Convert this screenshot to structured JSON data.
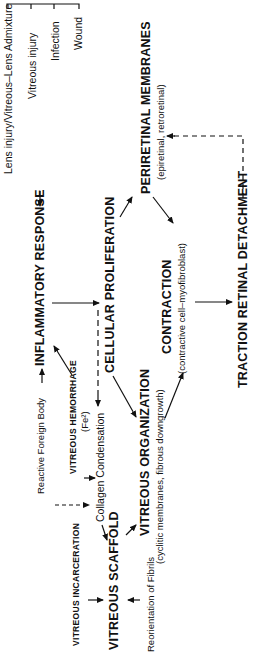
{
  "diagram": {
    "orientation": "rotated -90 degrees (text reads bottom-to-top)",
    "causes": {
      "items": [
        "Lens injury/Vitreous–Lens Admixture",
        "Vitreous injury",
        "Infection",
        "Wound"
      ]
    },
    "nodes": {
      "inflammatory_response": "INFLAMMATORY RESPONSE",
      "reactive_foreign_body": "Reactive Foreign Body",
      "vitreous_hemorrhage": "VITREOUS HEMORRHAGE",
      "vitreous_hemorrhage_note": "(Fe²)",
      "collagen_condensation": "Collagen Condensation",
      "vitreous_incarceration": "VITREOUS INCARCERATION",
      "vitreous_scaffold": "VITREOUS SCAFFOLD",
      "reorientation_of_fibrils": "Reorientation of Fibrils",
      "cellular_proliferation": "CELLULAR PROLIFERATION",
      "vitreous_organization": "VITREOUS ORGANIZATION",
      "vitreous_organization_note": "(cyclitic membranes, fibrous downgrowth)",
      "periretinal_membranes": "PERIRETINAL MEMBRANES",
      "periretinal_membranes_note": "(epiretinal, retroretinal)",
      "contraction": "CONTRACTION",
      "contraction_note": "(contractive cell–myofibroblast)",
      "traction_retinal_detachment": "TRACTION RETINAL DETACHMENT"
    },
    "edges": [
      {
        "from": "causes",
        "to": "inflammatory_response",
        "style": "solid"
      },
      {
        "from": "reactive_foreign_body",
        "to": "inflammatory_response",
        "style": "solid"
      },
      {
        "from": "vitreous_hemorrhage",
        "to": "inflammatory_response",
        "style": "solid"
      },
      {
        "from": "inflammatory_response",
        "to": "cellular_proliferation",
        "style": "solid"
      },
      {
        "from": "inflammatory_response",
        "to": "collagen_condensation",
        "style": "dashed"
      },
      {
        "from": "reactive_foreign_body",
        "to": "collagen_condensation",
        "style": "dashed"
      },
      {
        "from": "vitreous_hemorrhage",
        "to": "collagen_condensation",
        "style": "solid"
      },
      {
        "from": "collagen_condensation",
        "to": "vitreous_scaffold",
        "style": "solid"
      },
      {
        "from": "vitreous_incarceration",
        "to": "vitreous_scaffold",
        "style": "solid"
      },
      {
        "from": "reorientation_of_fibrils",
        "to": "vitreous_scaffold",
        "style": "solid"
      },
      {
        "from": "vitreous_scaffold",
        "to": "vitreous_organization",
        "style": "solid"
      },
      {
        "from": "cellular_proliferation",
        "to": "vitreous_organization",
        "style": "solid"
      },
      {
        "from": "cellular_proliferation",
        "to": "periretinal_membranes",
        "style": "solid"
      },
      {
        "from": "vitreous_organization",
        "to": "contraction",
        "style": "solid"
      },
      {
        "from": "periretinal_membranes",
        "to": "contraction",
        "style": "solid"
      },
      {
        "from": "contraction",
        "to": "traction_retinal_detachment",
        "style": "solid"
      },
      {
        "from": "traction_retinal_detachment",
        "to": "periretinal_membranes",
        "style": "dashed"
      }
    ]
  }
}
